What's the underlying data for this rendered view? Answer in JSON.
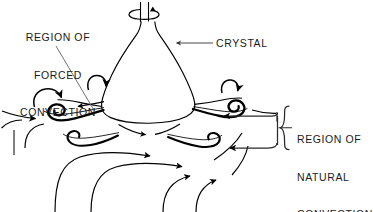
{
  "figure": {
    "type": "line-diagram",
    "background_color": "#ffffff",
    "ink_color": "#000000",
    "leader_color": "#555555"
  },
  "labels": {
    "forced_convection": {
      "name": "region-of-forced-convection",
      "line1": "REGION OF",
      "line2": "FORCED",
      "line3": "CONVECTION",
      "align": "center"
    },
    "crystal": {
      "name": "crystal",
      "text": "CRYSTAL",
      "align": "left"
    },
    "natural_convection": {
      "name": "region-of-natural-convection",
      "line1": "REGION OF",
      "line2": "NATURAL",
      "line3": "CONVECTION",
      "align": "left"
    }
  },
  "annotations": {
    "brace": "curly-brace-right",
    "rotation": "crystal-rotation-arrow",
    "crystal_leader": "horizontal-leader-line-with-arrowhead",
    "forced_leader": "diagonal-leader-line"
  }
}
